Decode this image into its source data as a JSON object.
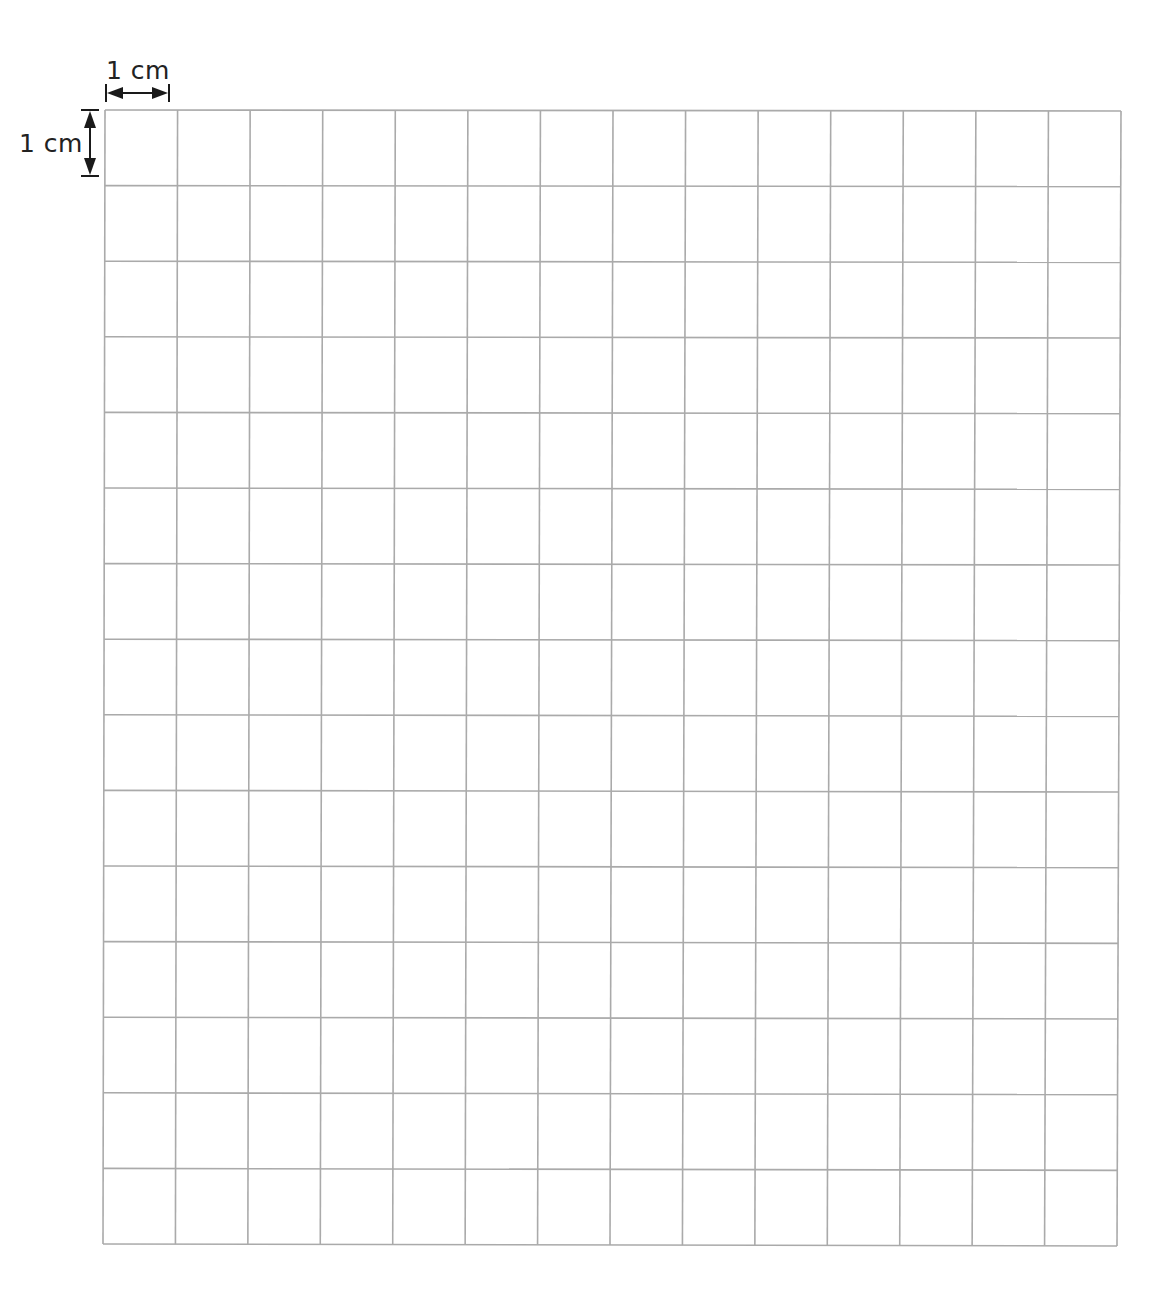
{
  "diagram": {
    "type": "grid-paper",
    "columns": 14,
    "rows": 15,
    "cell_size_label": "1 cm",
    "line_color": "#aaaaaa",
    "arrow_color": "#1a1a1a",
    "text_color": "#222222",
    "corners": {
      "top_left": [
        105,
        110
      ],
      "top_right": [
        1121,
        111
      ],
      "bottom_left": [
        103,
        1244
      ],
      "bottom_right": [
        1117,
        1246
      ]
    }
  },
  "annotations": {
    "horizontal_label": "1 cm",
    "vertical_label": "1 cm"
  }
}
